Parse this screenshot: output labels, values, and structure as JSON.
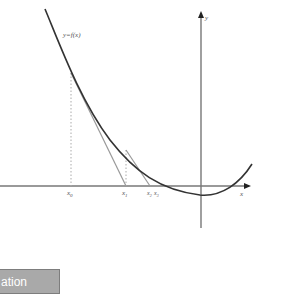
{
  "figure": {
    "curve_label": "y=f(x)",
    "x_axis_label": "x",
    "y_axis_label": "y",
    "points": [
      {
        "label": "x0",
        "base": "x",
        "sub": "0"
      },
      {
        "label": "x1",
        "base": "x",
        "sub": "1"
      },
      {
        "label": "x2",
        "base": "x",
        "sub": "2"
      },
      {
        "label": "x3",
        "base": "x",
        "sub": "3"
      }
    ],
    "colors": {
      "curve": "#333333",
      "tangent": "#999999",
      "axis": "#777777",
      "guide": "#aaaaaa"
    }
  },
  "button": {
    "label": "ation"
  }
}
